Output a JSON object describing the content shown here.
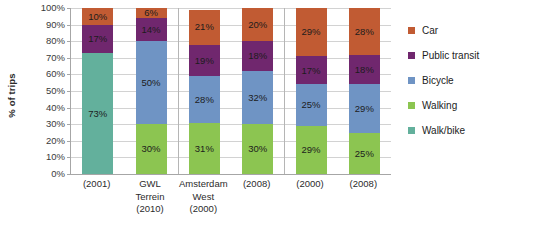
{
  "chart_data": {
    "type": "bar",
    "subtype": "stacked-percentage",
    "title": "",
    "xlabel": "",
    "ylabel": "% of trips",
    "ylim": [
      0,
      100
    ],
    "ytick_labels": [
      "0%",
      "10%",
      "20%",
      "30%",
      "40%",
      "50%",
      "60%",
      "70%",
      "80%",
      "90%",
      "100%"
    ],
    "ytick_values": [
      0,
      10,
      20,
      30,
      40,
      50,
      60,
      70,
      80,
      90,
      100
    ],
    "grid": true,
    "legend_position": "right",
    "categories": [
      "(2001)",
      "GWL Terrein (2010)",
      "Amsterdam West (2000)",
      "(2008)",
      "(2000)",
      "(2008)"
    ],
    "category_lines": [
      [
        "(2001)"
      ],
      [
        "GWL",
        "Terrein",
        "(2010)"
      ],
      [
        "Amsterdam",
        "West",
        "(2000)"
      ],
      [
        "(2008)"
      ],
      [
        "(2000)"
      ],
      [
        "(2008)"
      ]
    ],
    "series": [
      {
        "name": "Walk/bike",
        "color": "#63b09c",
        "values": [
          73,
          null,
          null,
          null,
          null,
          null
        ],
        "labels": [
          "73%",
          "",
          "",
          "",
          "",
          ""
        ]
      },
      {
        "name": "Walking",
        "color": "#8cc551",
        "values": [
          null,
          30,
          31,
          30,
          29,
          25
        ],
        "labels": [
          "",
          "30%",
          "31%",
          "30%",
          "29%",
          "25%"
        ]
      },
      {
        "name": "Bicycle",
        "color": "#6f94c4",
        "values": [
          null,
          50,
          28,
          32,
          25,
          29
        ],
        "labels": [
          "",
          "50%",
          "28%",
          "32%",
          "25%",
          "29%"
        ]
      },
      {
        "name": "Public transit",
        "color": "#70276e",
        "values": [
          17,
          14,
          19,
          18,
          17,
          18
        ],
        "labels": [
          "17%",
          "14%",
          "19%",
          "18%",
          "17%",
          "18%"
        ]
      },
      {
        "name": "Car",
        "color": "#c15b33",
        "values": [
          10,
          6,
          21,
          20,
          29,
          28
        ],
        "labels": [
          "10%",
          "6%",
          "21%",
          "20%",
          "29%",
          "28%"
        ]
      }
    ],
    "legend_entries": [
      {
        "label": "Car",
        "color": "#c15b33"
      },
      {
        "label": "Public transit",
        "color": "#70276e"
      },
      {
        "label": "Bicycle",
        "color": "#6f94c4"
      },
      {
        "label": "Walking",
        "color": "#8cc551"
      },
      {
        "label": "Walk/bike",
        "color": "#63b09c"
      }
    ],
    "group_separators_after": [
      1,
      3
    ]
  }
}
